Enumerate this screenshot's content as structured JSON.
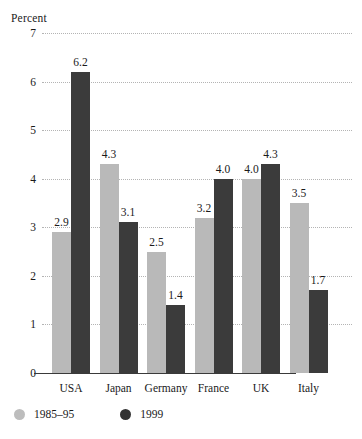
{
  "chart_data": {
    "type": "bar",
    "title": "",
    "ylabel": "Percent",
    "xlabel": "",
    "ylim": [
      0,
      7
    ],
    "yticks": [
      0,
      1,
      2,
      3,
      4,
      5,
      6,
      7
    ],
    "grid": true,
    "legend_position": "bottom-left",
    "categories": [
      "USA",
      "Japan",
      "Germany",
      "France",
      "UK",
      "Italy"
    ],
    "series": [
      {
        "name": "1985–95",
        "color": "#b9b9b9",
        "values": [
          2.9,
          4.3,
          2.5,
          3.2,
          4.0,
          3.5
        ],
        "labels": [
          "2.9",
          "4.3",
          "2.5",
          "3.2",
          "4.0",
          "3.5"
        ]
      },
      {
        "name": "1999",
        "color": "#3b3b3b",
        "values": [
          6.2,
          3.1,
          1.4,
          4.0,
          4.3,
          1.7
        ],
        "labels": [
          "6.2",
          "3.1",
          "1.4",
          "4.0",
          "4.3",
          "1.7"
        ]
      }
    ]
  },
  "axis": {
    "title": "Percent",
    "tick_labels": [
      "7",
      "6",
      "5",
      "4",
      "3",
      "2",
      "1",
      "0"
    ]
  },
  "legend": {
    "items": [
      {
        "label": "1985–95"
      },
      {
        "label": "1999"
      }
    ]
  }
}
